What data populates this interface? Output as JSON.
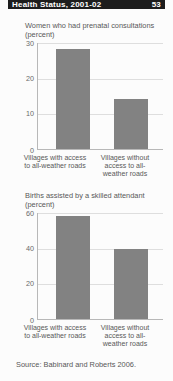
{
  "header": {
    "title": "Health Status, 2001-02",
    "page_number": "53"
  },
  "source_note": "Source: Babinard and Roberts 2006.",
  "charts": [
    {
      "title": "Women who had prenatal consultations",
      "unit": "(percent)",
      "yticks": [
        "30",
        "20",
        "10",
        "0"
      ],
      "categories": [
        "Villages with access to all-weather roads",
        "Villages without access to all-weather roads"
      ],
      "values": [
        28,
        14
      ]
    },
    {
      "title": "Births assisted by a skilled attendant",
      "unit": "(percent)",
      "yticks": [
        "60",
        "40",
        "20",
        "0"
      ],
      "categories": [
        "Villages with access to all-weather roads",
        "Villages without access to all-weather roads"
      ],
      "values": [
        58,
        39
      ]
    }
  ],
  "chart_data": [
    {
      "type": "bar",
      "title": "Women who had prenatal consultations (percent)",
      "categories": [
        "Villages with access to all-weather roads",
        "Villages without access to all-weather roads"
      ],
      "values": [
        28,
        14
      ],
      "xlabel": "",
      "ylabel": "percent",
      "ylim": [
        0,
        30
      ],
      "yticks": [
        0,
        10,
        20,
        30
      ],
      "grid": true,
      "legend": false,
      "bar_color": "#828282"
    },
    {
      "type": "bar",
      "title": "Births assisted by a skilled attendant (percent)",
      "categories": [
        "Villages with access to all-weather roads",
        "Villages without access to all-weather roads"
      ],
      "values": [
        58,
        39
      ],
      "xlabel": "",
      "ylabel": "percent",
      "ylim": [
        0,
        60
      ],
      "yticks": [
        0,
        20,
        40,
        60
      ],
      "grid": true,
      "legend": false,
      "bar_color": "#828282"
    }
  ]
}
